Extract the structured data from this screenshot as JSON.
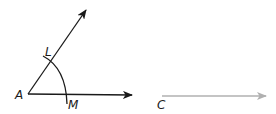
{
  "diagram": {
    "labels": {
      "A": "A",
      "L": "L",
      "M": "M",
      "C": "C"
    },
    "colors": {
      "ink": "#1a1a1a",
      "copy_ray": "#b0b0b0"
    }
  }
}
